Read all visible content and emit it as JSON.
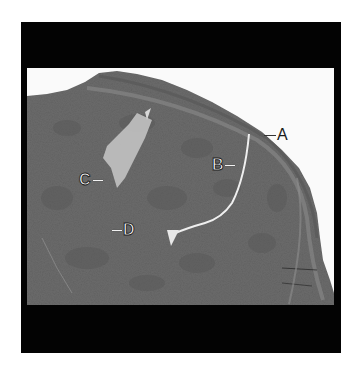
{
  "figure": {
    "type": "histology micrograph",
    "colors": {
      "frame": "#030303",
      "background": "#fafafa",
      "tissue": "#6b6b6b",
      "tissue_dark": "#575757",
      "tissue_light": "#c9c9c9",
      "capsule": "#7a7a7a"
    },
    "labels": [
      {
        "id": "A",
        "text": "A",
        "style": "dark"
      },
      {
        "id": "B",
        "text": "B",
        "style": "outlined"
      },
      {
        "id": "C",
        "text": "C",
        "style": "outlined"
      },
      {
        "id": "D",
        "text": "D",
        "style": "outlined"
      }
    ]
  }
}
